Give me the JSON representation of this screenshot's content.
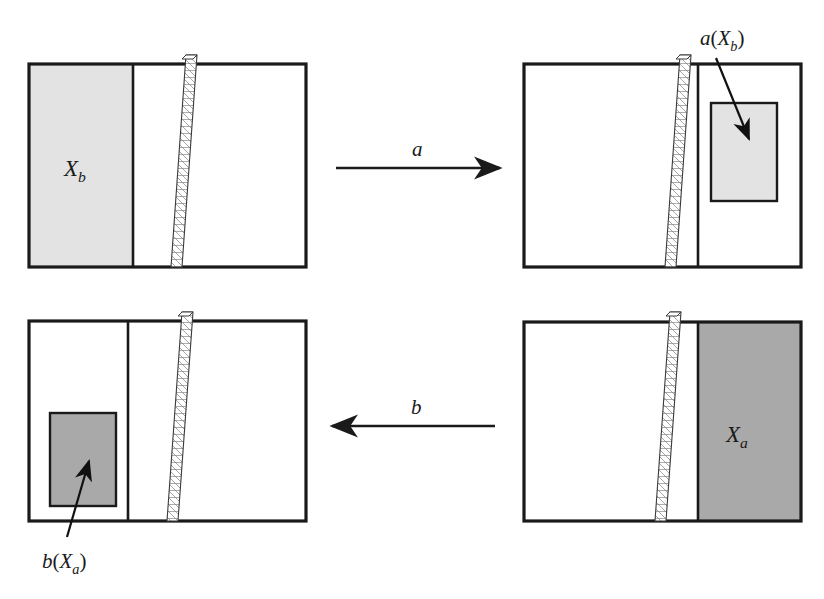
{
  "figure": {
    "background_color": "#ffffff",
    "stroke_color": "#1a1a1a",
    "fill_light_gray": "#e3e3e3",
    "fill_medium_gray": "#a9a9a9",
    "hatch_color": "#555555"
  },
  "panels": [
    {
      "id": "panel-top-left",
      "position": "top-left",
      "shaded_region_label": "X_b",
      "shaded_region_fill": "#e3e3e3",
      "shaded_region_side": "left",
      "has_hatched_wall": true,
      "has_inner_rectangle": false
    },
    {
      "id": "panel-top-right",
      "position": "top-right",
      "shaded_region_label": "",
      "shaded_region_fill": "#e3e3e3",
      "shaded_region_side": "inner-right",
      "has_hatched_wall": true,
      "has_inner_rectangle": true
    },
    {
      "id": "panel-bottom-left",
      "position": "bottom-left",
      "shaded_region_label": "",
      "shaded_region_fill": "#a9a9a9",
      "shaded_region_side": "inner-left",
      "has_hatched_wall": true,
      "has_inner_rectangle": true
    },
    {
      "id": "panel-bottom-right",
      "position": "bottom-right",
      "shaded_region_label": "X_a",
      "shaded_region_fill": "#a9a9a9",
      "shaded_region_side": "right",
      "has_hatched_wall": true,
      "has_inner_rectangle": false
    }
  ],
  "labels": {
    "xb": {
      "base": "X",
      "sub": "b"
    },
    "xa": {
      "base": "X",
      "sub": "a"
    },
    "a_of_xb": {
      "fn": "a",
      "open": "(",
      "base": "X",
      "sub": "b",
      "close": ")"
    },
    "b_of_xa": {
      "fn": "b",
      "open": "(",
      "base": "X",
      "sub": "a",
      "close": ")"
    }
  },
  "arrows": [
    {
      "id": "arrow-a",
      "label": "a",
      "direction": "right",
      "from_panel": "panel-top-left",
      "to_panel": "panel-top-right"
    },
    {
      "id": "arrow-b",
      "label": "b",
      "direction": "left",
      "from_panel": "panel-bottom-right",
      "to_panel": "panel-bottom-left"
    }
  ],
  "callouts": [
    {
      "id": "callout-a-xb",
      "label": "a(X_b)",
      "points_to": "panel-top-right inner rectangle"
    },
    {
      "id": "callout-b-xa",
      "label": "b(X_a)",
      "points_to": "panel-bottom-left inner rectangle"
    }
  ]
}
